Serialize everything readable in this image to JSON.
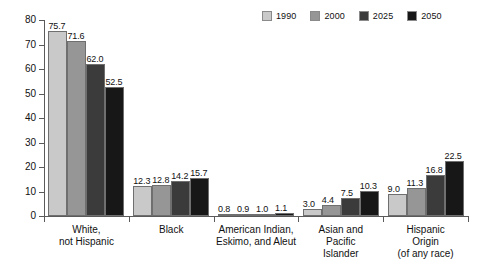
{
  "chart_data": {
    "type": "bar",
    "title": "",
    "subtitle": "",
    "xlabel": "",
    "ylabel": "",
    "ylim": [
      0,
      80
    ],
    "yticks": [
      0,
      10,
      20,
      30,
      40,
      50,
      60,
      70,
      80
    ],
    "grid": false,
    "legend_position": "top-right",
    "categories": [
      "White,\nnot Hispanic",
      "Black",
      "American Indian,\nEskimo, and Aleut",
      "Asian and\nPacific\nIslander",
      "Hispanic\nOrigin\n(of any race)"
    ],
    "series": [
      {
        "name": "1990",
        "color": "#c9c9c9",
        "values": [
          75.7,
          12.3,
          0.8,
          3.0,
          9.0
        ],
        "labels": [
          "75.7",
          "12.3",
          "0.8",
          "3.0",
          "9.0"
        ]
      },
      {
        "name": "2000",
        "color": "#969696",
        "values": [
          71.6,
          12.8,
          0.9,
          4.4,
          11.3
        ],
        "labels": [
          "71.6",
          "12.8",
          "0.9",
          "4.4",
          "11.3"
        ]
      },
      {
        "name": "2025",
        "color": "#3b3b3b",
        "values": [
          62.0,
          14.2,
          1.0,
          7.5,
          16.8
        ],
        "labels": [
          "62.0",
          "14.2",
          "1.0",
          "7.5",
          "16.8"
        ]
      },
      {
        "name": "2050",
        "color": "#171717",
        "values": [
          52.5,
          15.7,
          1.1,
          10.3,
          22.5
        ],
        "labels": [
          "52.5",
          "15.7",
          "1.1",
          "10.3",
          "22.5"
        ]
      }
    ]
  },
  "legend": {
    "items": [
      {
        "label": "1990",
        "color": "#c9c9c9"
      },
      {
        "label": "2000",
        "color": "#969696"
      },
      {
        "label": "2025",
        "color": "#3b3b3b"
      },
      {
        "label": "2050",
        "color": "#171717"
      }
    ]
  },
  "axis": {
    "y_tick_labels": [
      "80",
      "70",
      "60",
      "50",
      "40",
      "30",
      "20",
      "10",
      "0"
    ]
  }
}
